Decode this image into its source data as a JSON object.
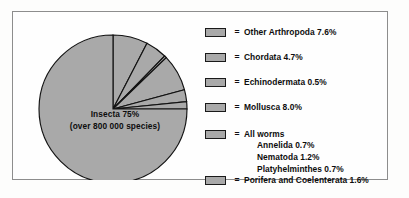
{
  "figure": {
    "frame_border_color": "#8d8d8d",
    "background_color": "#fefefe"
  },
  "pie": {
    "center_label_line1": "Insecta 75%",
    "center_label_line2": "(over 800 000 species)"
  },
  "legend": {
    "equals_symbol": "=",
    "swatch_fill": "#a9a9a9",
    "swatch_border": "#1a1a1a",
    "rows": [
      {
        "label": "Other Arthropoda 7.6%"
      },
      {
        "label": "Chordata 4.7%"
      },
      {
        "label": "Echinodermata 0.5%"
      },
      {
        "label": "Mollusca 8.0%"
      },
      {
        "label": "All worms",
        "sub_items": [
          "Annelida 0.7%",
          "Nematoda 1.2%",
          "Platyhelminthes 0.7%"
        ]
      },
      {
        "label": "Porifera and Coelenterata 1.6%"
      }
    ]
  },
  "chart_data": {
    "type": "pie",
    "title": "",
    "legend_position": "right",
    "units": "percent",
    "center_annotation": "Insecta 75% (over 800 000 species)",
    "start_angle_deg": 0,
    "direction": "clockwise",
    "slice_fill_color": "#a9a9a9",
    "slice_stroke_color": "#121212",
    "categories": [
      "Insecta",
      "Other Arthropoda",
      "Chordata",
      "Echinodermata",
      "Mollusca",
      "All worms",
      "Porifera and Coelenterata"
    ],
    "values": [
      75,
      7.6,
      4.7,
      0.5,
      8.0,
      2.6,
      1.6
    ],
    "slices": [
      {
        "name": "Other Arthropoda",
        "value": 7.6
      },
      {
        "name": "Chordata",
        "value": 4.7
      },
      {
        "name": "Echinodermata",
        "value": 0.5
      },
      {
        "name": "Mollusca",
        "value": 8.0
      },
      {
        "name": "All worms",
        "value": 2.6
      },
      {
        "name": "Porifera and Coelenterata",
        "value": 1.6
      },
      {
        "name": "Insecta",
        "value": 75
      }
    ],
    "subgroups": {
      "All worms": [
        {
          "name": "Annelida",
          "value": 0.7
        },
        {
          "name": "Nematoda",
          "value": 1.2
        },
        {
          "name": "Platyhelminthes",
          "value": 0.7
        }
      ]
    },
    "geometry": {
      "cx": 86,
      "cy": 96,
      "r": 74
    }
  }
}
